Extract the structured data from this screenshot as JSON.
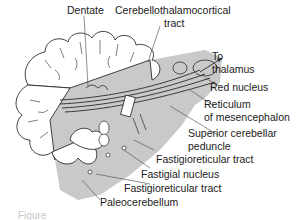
{
  "diagram": {
    "colors": {
      "background": "#ffffff",
      "brainstem_fill": "#c9c9c9",
      "cerebellum_fill": "#ffffff",
      "line": "#2a2a2a",
      "text": "#1b1b1b"
    },
    "labels": {
      "dentate": "Dentate",
      "cerebellothalamocortical_1": "Cerebellothalamocortical",
      "cerebellothalamocortical_2": "tract",
      "to_thalamus_1": "To",
      "to_thalamus_2": "thalamus",
      "red_nucleus": "Red nucleus",
      "reticulum_1": "Reticulum",
      "reticulum_2": "of mesencephalon",
      "superior_peduncle_1": "Superior cerebellar",
      "superior_peduncle_2": "peduncle",
      "fastigioreticular_upper": "Fastigioreticular tract",
      "fastigial_nucleus": "Fastigial nucleus",
      "fastigioreticular_lower": "Fastigioreticular tract",
      "paleocerebellum": "Paleocerebellum"
    },
    "caption_partial": "Figure"
  }
}
